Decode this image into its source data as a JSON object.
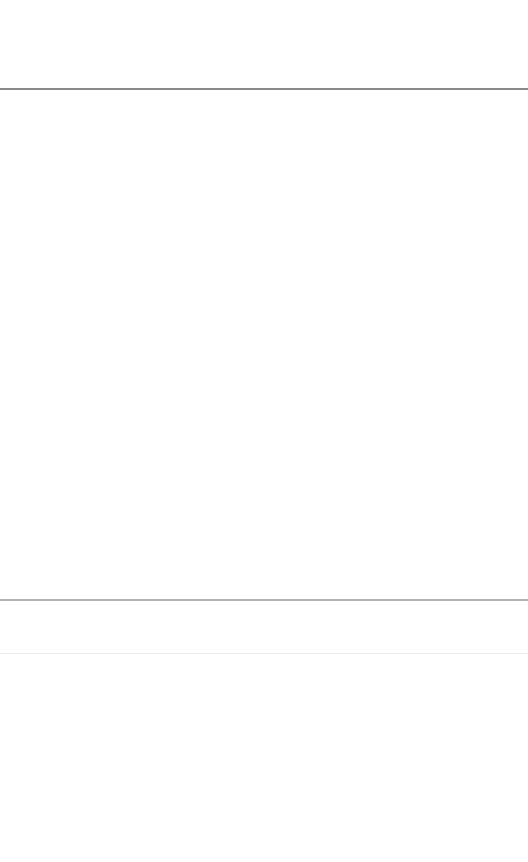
{
  "header": {
    "title": ""
  },
  "content": {
    "text": ""
  },
  "strip": {
    "text": ""
  },
  "footer": {
    "text": ""
  },
  "colors": {
    "background": "#ffffff",
    "divider_top": "#8a8a8a",
    "divider_mid": "#b4b4b4",
    "divider_faint": "#ececec"
  }
}
